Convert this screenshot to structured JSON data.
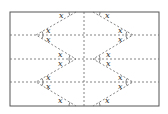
{
  "diagram": {
    "title": "",
    "rect": {
      "x1": 10,
      "y1": 12,
      "x2": 159,
      "y2": 106
    },
    "stroke_color": "#555555",
    "dash_color": "#666666",
    "horizontal_lines_y": [
      35,
      59,
      82
    ],
    "vertical_line_x": 84,
    "left_zigzag": [
      [
        76,
        12
      ],
      [
        36,
        35
      ],
      [
        76,
        59
      ],
      [
        36,
        82
      ],
      [
        76,
        106
      ]
    ],
    "right_zigzag": [
      [
        93,
        12
      ],
      [
        133,
        35
      ],
      [
        93,
        59
      ],
      [
        133,
        82
      ],
      [
        93,
        106
      ]
    ],
    "angle_label": "x",
    "labels": [
      {
        "x": 59,
        "y": 18,
        "text": "x"
      },
      {
        "x": 105,
        "y": 18,
        "text": "x"
      },
      {
        "x": 46,
        "y": 33,
        "text": "x"
      },
      {
        "x": 46,
        "y": 42,
        "text": "x"
      },
      {
        "x": 118,
        "y": 33,
        "text": "x"
      },
      {
        "x": 118,
        "y": 42,
        "text": "x"
      },
      {
        "x": 58,
        "y": 57,
        "text": "x"
      },
      {
        "x": 58,
        "y": 66,
        "text": "x"
      },
      {
        "x": 106,
        "y": 57,
        "text": "x"
      },
      {
        "x": 106,
        "y": 66,
        "text": "x"
      },
      {
        "x": 46,
        "y": 80,
        "text": "x"
      },
      {
        "x": 46,
        "y": 89,
        "text": "x"
      },
      {
        "x": 118,
        "y": 80,
        "text": "x"
      },
      {
        "x": 118,
        "y": 89,
        "text": "x"
      },
      {
        "x": 58,
        "y": 103,
        "text": "x"
      },
      {
        "x": 105,
        "y": 103,
        "text": "x"
      }
    ]
  }
}
